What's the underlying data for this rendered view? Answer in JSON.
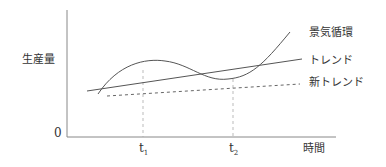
{
  "diagram": {
    "ylabel": "生産量",
    "origin": "0",
    "xlabel": "時間",
    "ticks": [
      {
        "label": "t",
        "sub": "1"
      },
      {
        "label": "t",
        "sub": "2"
      }
    ],
    "legend": {
      "cycle": "景気循環",
      "trend": "トレンド",
      "new_trend": "新トレンド"
    },
    "colors": {
      "line": "#555555",
      "dashed": "#666666",
      "guide": "#aaaaaa"
    }
  }
}
